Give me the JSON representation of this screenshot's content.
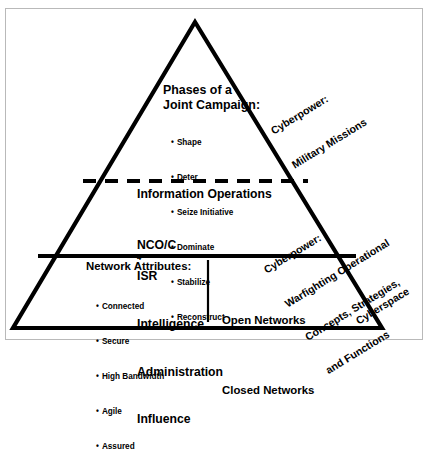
{
  "figure": {
    "shape": "pyramid-three-tiers",
    "colors": {
      "line": "#000000",
      "frame": "#b9b9b9",
      "background": "#ffffff"
    }
  },
  "tiers": {
    "top": {
      "heading_line1": "Phases of a",
      "heading_line2": "Joint Campaign:",
      "bullets": [
        "Shape",
        "Deter",
        "Seize Initiative",
        "Dominate",
        "Stabilize",
        "Reconstruct"
      ]
    },
    "middle": {
      "heading": "Information Operations",
      "items_line1_prefix": "NCO/C",
      "items_line1_sup": "4",
      "items_line1_suffix": "ISR",
      "items": [
        "Intelligence",
        "Administration",
        "Influence"
      ]
    },
    "bottom": {
      "heading": "Network Attributes:",
      "bullets": [
        "Connected",
        "Secure",
        "High Bandwidth",
        "Agile",
        "Assured"
      ],
      "right_items": [
        "Open Networks",
        "Closed Networks"
      ]
    }
  },
  "side_labels": {
    "top": [
      "Cyberpower:",
      "Military Missions"
    ],
    "middle": [
      "Cyberpower:",
      "Warfighting Operational",
      "Concepts, Strategies,",
      "and Functions"
    ],
    "bottom": [
      "Cyberspace"
    ]
  }
}
